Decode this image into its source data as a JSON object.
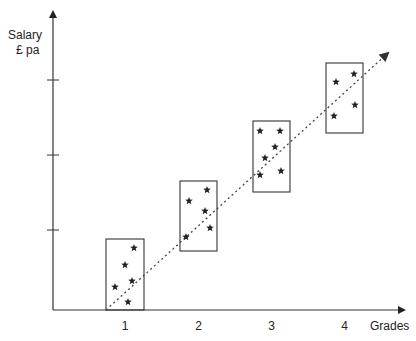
{
  "chart_data": {
    "type": "scatter",
    "title": "",
    "xlabel": "Grades",
    "ylabel_line1": "Salary",
    "ylabel_line2": "£ pa",
    "categories": [
      "1",
      "2",
      "3",
      "4"
    ],
    "series": [
      {
        "name": "Grade 1",
        "grade": 1,
        "box": {
          "x": 106,
          "y": 239,
          "w": 38,
          "h": 71
        },
        "points": [
          [
            134,
            248
          ],
          [
            125,
            265
          ],
          [
            132,
            281
          ],
          [
            115,
            287
          ],
          [
            128,
            302
          ]
        ]
      },
      {
        "name": "Grade 2",
        "grade": 2,
        "box": {
          "x": 180,
          "y": 181,
          "w": 37,
          "h": 70
        },
        "points": [
          [
            207,
            190
          ],
          [
            189,
            201
          ],
          [
            205,
            211
          ],
          [
            210,
            228
          ],
          [
            186,
            237
          ]
        ]
      },
      {
        "name": "Grade 3",
        "grade": 3,
        "box": {
          "x": 253,
          "y": 121,
          "w": 37,
          "h": 71
        },
        "points": [
          [
            260,
            131
          ],
          [
            280,
            131
          ],
          [
            275,
            147
          ],
          [
            265,
            158
          ],
          [
            260,
            175
          ],
          [
            281,
            171
          ]
        ]
      },
      {
        "name": "Grade 4",
        "grade": 4,
        "box": {
          "x": 326,
          "y": 63,
          "w": 37,
          "h": 70
        },
        "points": [
          [
            354,
            74
          ],
          [
            336,
            82
          ],
          [
            355,
            105
          ],
          [
            334,
            116
          ]
        ]
      }
    ],
    "trend_line": {
      "style": "dotted",
      "from": [
        106,
        310
      ],
      "to": [
        388,
        53
      ]
    },
    "y_ticks": [
      80,
      155,
      230
    ],
    "grid": false,
    "legend": "none"
  }
}
